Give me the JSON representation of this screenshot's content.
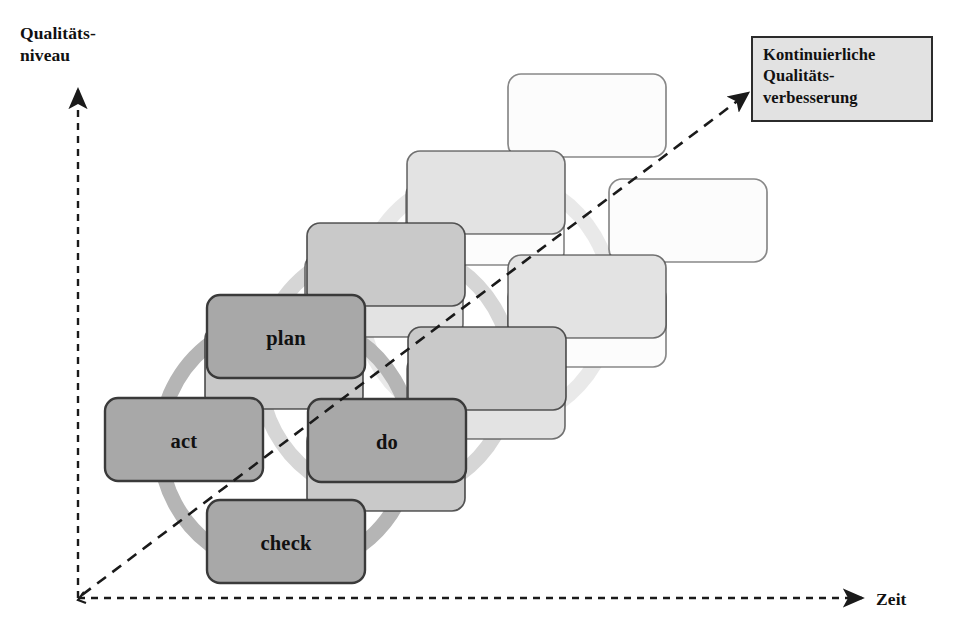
{
  "diagram": {
    "axes": {
      "y_label": "Qualitäts-\nniveau",
      "x_label": "Zeit",
      "y_axis_style": "dashed-arrow-up",
      "x_axis_style": "dashed-arrow-right",
      "origin": {
        "x": 78,
        "y": 598
      }
    },
    "trend": {
      "name": "improvement-trend-line",
      "style": "dashed-arrow",
      "from": {
        "x": 80,
        "y": 596
      },
      "to": {
        "x": 752,
        "y": 90
      }
    },
    "callout": {
      "text": "Kontinuierliche\nQualitäts-\nverbesserung",
      "fill": "#e2e2e2",
      "border": "#2b2b2b"
    },
    "cycle_steps": [
      "plan",
      "do",
      "check",
      "act"
    ],
    "cycle_repetitions": 4,
    "cycle_offset": {
      "dx": 100,
      "dy": -72
    },
    "colors": {
      "step_fill_front": "#a8a8a8",
      "step_fill_2": "#c9c9c9",
      "step_fill_3": "#e3e3e3",
      "step_fill_4": "#fbfbfb",
      "step_border": "#3a3a3a",
      "arc_arrow": "#b5b5b5",
      "axis": "#1a1a1a",
      "text": "#111111"
    },
    "cycles": [
      {
        "index": 0,
        "visible_labels": true,
        "fill": "#a8a8a8",
        "border_opacity": 1.0,
        "arc_opacity": 1.0,
        "boxes": [
          {
            "step": "plan",
            "x": 207,
            "y": 295,
            "w": 158,
            "h": 83
          },
          {
            "step": "do",
            "x": 308,
            "y": 399,
            "w": 158,
            "h": 83
          },
          {
            "step": "check",
            "x": 207,
            "y": 500,
            "w": 158,
            "h": 83
          },
          {
            "step": "act",
            "x": 105,
            "y": 398,
            "w": 158,
            "h": 83
          }
        ]
      },
      {
        "index": 1,
        "visible_labels": false,
        "fill": "#c9c9c9",
        "border_opacity": 0.85,
        "arc_opacity": 0.55,
        "boxes": [
          {
            "step": "plan",
            "x": 307,
            "y": 223,
            "w": 158,
            "h": 83
          },
          {
            "step": "do",
            "x": 408,
            "y": 327,
            "w": 158,
            "h": 83
          },
          {
            "step": "check",
            "x": 307,
            "y": 428,
            "w": 158,
            "h": 83
          },
          {
            "step": "act",
            "x": 205,
            "y": 326,
            "w": 158,
            "h": 83
          }
        ]
      },
      {
        "index": 2,
        "visible_labels": false,
        "fill": "#e3e3e3",
        "border_opacity": 0.7,
        "arc_opacity": 0.3,
        "boxes": [
          {
            "step": "plan",
            "x": 407,
            "y": 151,
            "w": 158,
            "h": 83
          },
          {
            "step": "do",
            "x": 508,
            "y": 255,
            "w": 158,
            "h": 83
          },
          {
            "step": "check",
            "x": 407,
            "y": 356,
            "w": 158,
            "h": 83
          },
          {
            "step": "act",
            "x": 305,
            "y": 254,
            "w": 158,
            "h": 83
          }
        ]
      },
      {
        "index": 3,
        "visible_labels": false,
        "fill": "#fcfcfc",
        "border_opacity": 0.6,
        "arc_opacity": 0.0,
        "boxes": [
          {
            "step": "plan",
            "x": 508,
            "y": 74,
            "w": 158,
            "h": 83
          },
          {
            "step": "do",
            "x": 609,
            "y": 179,
            "w": 158,
            "h": 83
          },
          {
            "step": "check",
            "x": 508,
            "y": 284,
            "w": 158,
            "h": 83
          },
          {
            "step": "act",
            "x": 406,
            "y": 182,
            "w": 158,
            "h": 83
          }
        ]
      }
    ]
  }
}
